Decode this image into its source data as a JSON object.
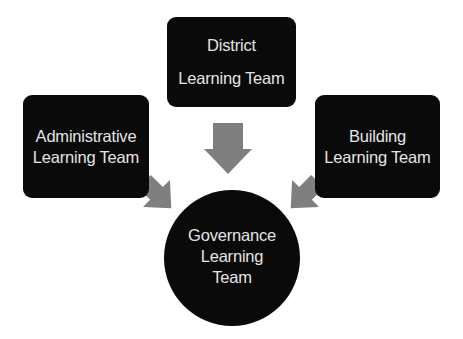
{
  "diagram": {
    "type": "flow-converging",
    "colors": {
      "node_fill": "#0a0a0a",
      "node_text": "#e4e4e4",
      "arrow_fill": "#7f7f7f",
      "background": "#ffffff"
    },
    "nodes": {
      "district": {
        "shape": "rounded-rectangle",
        "lines": [
          "District",
          "Learning Team"
        ]
      },
      "administrative": {
        "shape": "rounded-rectangle",
        "lines": [
          "Administrative",
          "Learning Team"
        ]
      },
      "building": {
        "shape": "rounded-rectangle",
        "lines": [
          "Building",
          "Learning Team"
        ]
      },
      "governance": {
        "shape": "circle",
        "lines": [
          "Governance",
          "Learning",
          "Team"
        ]
      }
    },
    "edges": [
      {
        "from": "district",
        "to": "governance",
        "direction": "down"
      },
      {
        "from": "administrative",
        "to": "governance",
        "direction": "down-right"
      },
      {
        "from": "building",
        "to": "governance",
        "direction": "down-left"
      }
    ]
  }
}
